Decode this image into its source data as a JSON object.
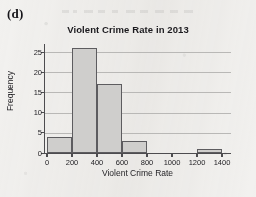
{
  "panel": {
    "label": "(d)"
  },
  "chart_data": {
    "type": "bar",
    "title": "Violent Crime Rate in 2013",
    "xlabel": "Violent Crime Rate",
    "ylabel": "Frequency",
    "bin_width": 200,
    "bin_edges": [
      0,
      200,
      400,
      600,
      800,
      1000,
      1200,
      1400
    ],
    "categories": [
      "0-200",
      "200-400",
      "400-600",
      "600-800",
      "800-1000",
      "1000-1200",
      "1200-1400"
    ],
    "values": [
      4,
      26,
      17,
      3,
      0,
      0,
      1
    ],
    "xlim": [
      0,
      1400
    ],
    "ylim": [
      0,
      27
    ],
    "xticks": [
      0,
      200,
      400,
      600,
      800,
      1000,
      1200,
      1400
    ],
    "xtick_labels": [
      "0",
      "200",
      "400",
      "600",
      "800",
      "1000",
      "1200",
      "1400"
    ],
    "yticks": [
      0,
      5,
      10,
      15,
      20,
      25
    ],
    "ytick_labels": [
      "0",
      "5",
      "10",
      "15",
      "20",
      "25"
    ],
    "grid": "horizontal",
    "legend": "none",
    "bar_fill_color": "#cfcecc",
    "bar_edge_color": "#5d5c5f",
    "gridline_color": "#b9b8b6",
    "axis_color": "#4d4c4f",
    "background_color": "#f2f1ef"
  }
}
